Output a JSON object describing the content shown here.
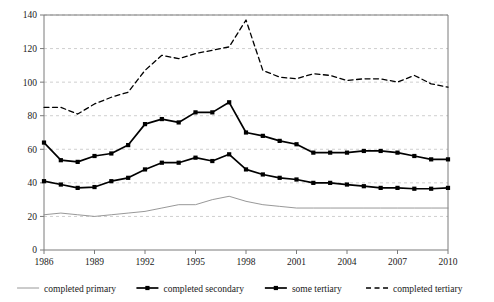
{
  "chart_data": {
    "type": "line",
    "title": "",
    "xlabel": "",
    "ylabel": "",
    "xlim": [
      1986,
      2010
    ],
    "ylim": [
      0,
      140
    ],
    "ytick_values": [
      0,
      20,
      40,
      60,
      80,
      100,
      120,
      140
    ],
    "ytick_labels": [
      "0",
      "20",
      "40",
      "60",
      "80",
      "100",
      "120",
      "140"
    ],
    "xtick_values": [
      1986,
      1989,
      1992,
      1995,
      1998,
      2001,
      2004,
      2007,
      2010
    ],
    "xtick_labels": [
      "1986",
      "1989",
      "1992",
      "1995",
      "1998",
      "2001",
      "2004",
      "2007",
      "2010"
    ],
    "x": [
      1986,
      1987,
      1988,
      1989,
      1990,
      1991,
      1992,
      1993,
      1994,
      1995,
      1996,
      1997,
      1998,
      1999,
      2000,
      2001,
      2002,
      2003,
      2004,
      2005,
      2006,
      2007,
      2008,
      2009,
      2010
    ],
    "grid": "horizontal-dashed",
    "legend_position": "bottom",
    "series": [
      {
        "name": "completed primary",
        "style": "thin-solid-gray",
        "marker": "none",
        "color": "#8c8c8c",
        "values": [
          21,
          22,
          21,
          20,
          21,
          22,
          23,
          25,
          27,
          27,
          30,
          32,
          29,
          27,
          26,
          25,
          25,
          25,
          25,
          25,
          25,
          25,
          25,
          25,
          25
        ]
      },
      {
        "name": "completed secondary",
        "style": "bold-solid-black",
        "marker": "square",
        "color": "#000000",
        "values": [
          41,
          39,
          37,
          37.5,
          41,
          43,
          48,
          52,
          52,
          55,
          53,
          57,
          48,
          45,
          43,
          42,
          40,
          40,
          39,
          38,
          37,
          37,
          36.5,
          36.5,
          37
        ]
      },
      {
        "name": "some tertiary",
        "style": "bold-solid-black",
        "marker": "square",
        "color": "#000000",
        "values": [
          64,
          53.5,
          52.5,
          56,
          57.5,
          62.5,
          75,
          78,
          76,
          82,
          82,
          88,
          70,
          68,
          65,
          63,
          58,
          58,
          58,
          59,
          59,
          58,
          56,
          54,
          54
        ]
      },
      {
        "name": "completed tertiary",
        "style": "dashed-black",
        "marker": "none",
        "color": "#000000",
        "values": [
          85,
          85,
          81,
          87,
          91,
          94,
          107,
          116,
          114,
          117,
          119,
          121,
          137,
          107,
          103,
          102,
          105,
          104,
          101,
          102,
          102,
          100,
          104,
          99,
          97
        ]
      }
    ]
  },
  "legend": {
    "items": [
      {
        "label": "completed primary",
        "style": "thin-line"
      },
      {
        "label": "completed secondary",
        "style": "marker-line"
      },
      {
        "label": "some tertiary",
        "style": "marker-line"
      },
      {
        "label": "completed tertiary",
        "style": "dashed-line"
      }
    ]
  },
  "colors": {
    "axis": "#7a7a7a",
    "grid": "#c9c9c9",
    "primary_line": "#8c8c8c",
    "series_black": "#000000",
    "text": "#1a1a1a"
  }
}
